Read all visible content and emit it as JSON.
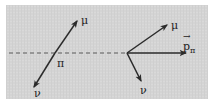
{
  "figure": {
    "name": "pion-decay-kinematics",
    "caption": "",
    "background_color": "#d4d4d4",
    "plate_color": "#ffffff",
    "line_color": "#2b2b2b",
    "dashed_axis_color": "#5a5a5a",
    "label_color": "#1b1b1b",
    "frame": {
      "x": 6,
      "y": 5,
      "width": 202,
      "height": 94
    }
  },
  "axis": {
    "name": "pion-flight-axis",
    "style": "dashed",
    "x_start": 9,
    "x_end": 128,
    "y": 53
  },
  "panels": [
    {
      "id": "left",
      "name": "pion-decay-at-rest",
      "vertex": {
        "x": 55,
        "y": 53
      },
      "arrows": [
        {
          "id": "left-muon",
          "name": "muon-arrow",
          "label": "μ",
          "label_x": 82,
          "label_y": 22,
          "x1": 55,
          "y1": 53,
          "x2": 78,
          "y2": 20,
          "arrowhead": true
        },
        {
          "id": "left-neutrino",
          "name": "neutrino-arrow",
          "label": "ν",
          "label_x": 37,
          "label_y": 95,
          "x1": 55,
          "y1": 53,
          "x2": 33,
          "y2": 88,
          "arrowhead": true
        }
      ],
      "vertex_label": {
        "name": "pion-label",
        "text": "π",
        "x": 58,
        "y": 66
      }
    },
    {
      "id": "right",
      "name": "pion-decay-in-flight",
      "vertex": {
        "x": 127,
        "y": 53
      },
      "arrows": [
        {
          "id": "right-muon",
          "name": "muon-arrow",
          "label": "μ",
          "label_x": 172,
          "label_y": 27,
          "x1": 127,
          "y1": 53,
          "x2": 168,
          "y2": 24,
          "arrowhead": true
        },
        {
          "id": "right-pion-momentum",
          "name": "pion-momentum-arrow",
          "label": "p",
          "label_sub": "π",
          "label_x": 190,
          "label_y": 48,
          "x1": 127,
          "y1": 53,
          "x2": 187,
          "y2": 53,
          "arrowhead": true
        },
        {
          "id": "right-neutrino",
          "name": "neutrino-arrow",
          "label": "ν",
          "label_x": 144,
          "label_y": 93,
          "x1": 127,
          "y1": 53,
          "x2": 142,
          "y2": 82,
          "arrowhead": true
        }
      ],
      "vertex_label": null
    }
  ],
  "labels": {
    "muon_left": "μ",
    "neutrino_left": "ν",
    "pion_rest": "π",
    "muon_right": "μ",
    "neutrino_right": "ν",
    "pion_momentum_symbol": "p",
    "pion_momentum_subscript": "π",
    "pion_momentum_vector_mark": "→"
  }
}
